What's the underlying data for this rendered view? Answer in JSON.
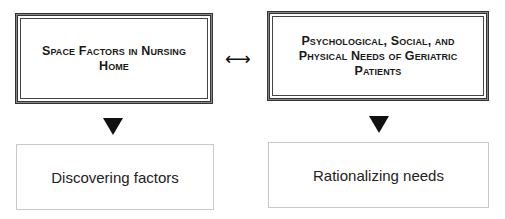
{
  "diagram": {
    "left": {
      "top_label": "Space Factors in Nursing Home",
      "bottom_label": "Discovering factors"
    },
    "right": {
      "top_label": "Psychological, Social, and Physical Needs of Geriatric Patients",
      "bottom_label": "Rationalizing needs"
    },
    "connector": {
      "glyph": "⟷",
      "meaning": "bidirectional-arrow"
    },
    "down_arrow_glyph": "▼"
  }
}
